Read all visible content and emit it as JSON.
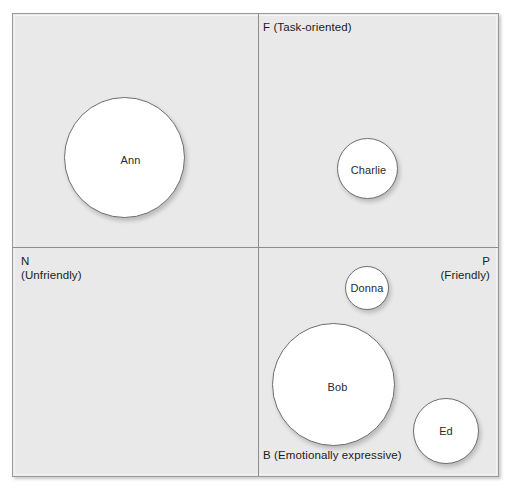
{
  "diagram": {
    "type": "bubble-quadrant",
    "axes": {
      "top": {
        "code": "F",
        "description": "(Task-oriented)",
        "text": "F (Task-oriented)"
      },
      "bottom": {
        "code": "B",
        "description": "(Emotionally expressive)",
        "text": "B (Emotionally expressive)"
      },
      "left": {
        "code": "N",
        "description": "(Unfriendly)",
        "text": "N\n(Unfriendly)"
      },
      "right": {
        "code": "P",
        "description": "(Friendly)",
        "text": "P\n(Friendly)"
      }
    },
    "bubbles": [
      {
        "label": "Ann",
        "quadrant": "N-F",
        "size": "large"
      },
      {
        "label": "Charlie",
        "quadrant": "P-F",
        "size": "small"
      },
      {
        "label": "Donna",
        "quadrant": "P-B",
        "size": "xsmall"
      },
      {
        "label": "Bob",
        "quadrant": "P-B",
        "size": "large"
      },
      {
        "label": "Ed",
        "quadrant": "P-B",
        "size": "small"
      }
    ],
    "colors": {
      "panel_fill": "#e9e9e9",
      "panel_border": "#9a9a9a",
      "axis_line": "#8c8c8c",
      "bubble_fill": "#ffffff",
      "bubble_border": "#6e6e6e",
      "text": "#1b1b1b"
    }
  }
}
